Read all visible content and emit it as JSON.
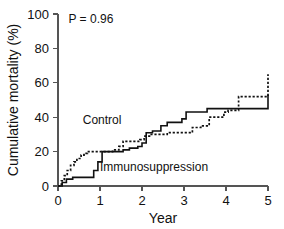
{
  "chart_data": {
    "type": "line",
    "title": "",
    "subtitle": "",
    "xlabel": "Year",
    "ylabel": "Cumulative mortality (%)",
    "xlim": [
      0,
      5
    ],
    "ylim": [
      0,
      100
    ],
    "xticks": [
      0,
      1,
      2,
      3,
      4,
      5
    ],
    "xtick_labels": [
      "0",
      "1",
      "2",
      "3",
      "4",
      "5"
    ],
    "yticks": [
      0,
      20,
      40,
      60,
      80,
      100
    ],
    "ytick_labels": [
      "0",
      "20",
      "40",
      "60",
      "80",
      "100"
    ],
    "grid": false,
    "legend_position": "inline-annotations",
    "annotations": [
      {
        "name": "p-value",
        "text": "P = 0.96",
        "x": 0.25,
        "y": 95
      }
    ],
    "series": [
      {
        "name": "Control",
        "style": "dashed",
        "label_text": "Control",
        "label_x": 1.05,
        "label_y": 36,
        "step": "post",
        "x": [
          0.0,
          0.08,
          0.15,
          0.22,
          0.3,
          0.38,
          0.45,
          0.55,
          0.62,
          0.7,
          0.85,
          1.0,
          1.3,
          1.45,
          1.55,
          1.8,
          1.95,
          2.05,
          2.2,
          2.45,
          2.6,
          3.05,
          3.2,
          3.4,
          3.6,
          3.95,
          4.05,
          4.3,
          5.0
        ],
        "y": [
          0,
          3,
          6,
          9,
          12,
          14,
          16,
          18,
          19,
          20,
          20,
          20,
          21,
          23,
          26,
          26,
          27,
          29,
          30,
          30,
          31,
          31,
          34,
          35,
          40,
          43,
          44,
          52,
          65
        ]
      },
      {
        "name": "Immunosuppression",
        "style": "solid",
        "label_text": "Immunosuppression",
        "label_x": 1.0,
        "label_y": 9,
        "step": "post",
        "x": [
          0.0,
          0.1,
          0.2,
          0.35,
          0.6,
          0.85,
          0.95,
          1.05,
          1.45,
          1.55,
          1.7,
          1.9,
          2.0,
          2.1,
          2.25,
          2.45,
          2.6,
          2.95,
          3.05,
          3.55,
          3.95,
          4.3,
          5.0
        ],
        "y": [
          0,
          2,
          4,
          5,
          5,
          9,
          14,
          20,
          20,
          21,
          22,
          23,
          25,
          31,
          32,
          35,
          37,
          39,
          43,
          45,
          45,
          45,
          53
        ]
      }
    ]
  }
}
